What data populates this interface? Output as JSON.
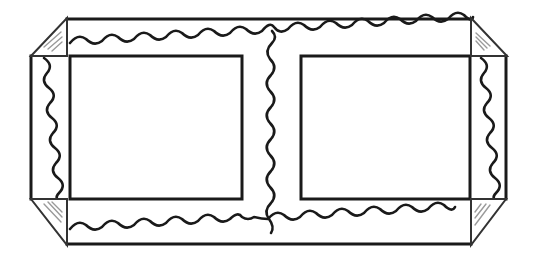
{
  "diagram": {
    "colors": {
      "line": "#1a1a1a",
      "corner_stroke": "#333333",
      "glint": "#9a9a9a",
      "background": "#ffffff"
    },
    "parts": [
      {
        "id": "outer-band-top",
        "label": "Top band"
      },
      {
        "id": "outer-band-bottom",
        "label": "Bottom band"
      },
      {
        "id": "outer-band-left",
        "label": "Left band"
      },
      {
        "id": "outer-band-right",
        "label": "Right band"
      },
      {
        "id": "window-left",
        "label": "Left window"
      },
      {
        "id": "window-right",
        "label": "Right window"
      },
      {
        "id": "center-divider",
        "label": "Center wavy divider"
      },
      {
        "id": "corner-tl",
        "label": "Top-left corner"
      },
      {
        "id": "corner-tr",
        "label": "Top-right corner"
      },
      {
        "id": "corner-bl",
        "label": "Bottom-left corner"
      },
      {
        "id": "corner-br",
        "label": "Bottom-right corner"
      }
    ]
  }
}
